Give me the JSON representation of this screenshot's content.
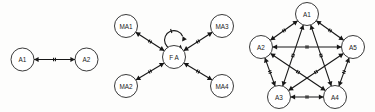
{
  "figure": {
    "name": "agent-interaction-graphs",
    "background_color": "#fdfdfc",
    "stroke_color": "#171717",
    "node_fill_color": "#ffffff",
    "node_stroke_color": "#242424",
    "label_color": "#1a1a1a",
    "node_font_size": 6.4,
    "node_radius": 11.5,
    "edge_stroke_width": 1.1,
    "node_stroke_width": 0.9,
    "edge_style": "double-headed arrow with two tick marks at midpoint",
    "panel_count": 3
  },
  "panels": [
    {
      "id": "panel-left",
      "name": "two-agent-graph",
      "nodes": [
        {
          "id": "n_a1",
          "label": "A1",
          "cx": 22.5,
          "cy": 59.5,
          "r": 11.5
        },
        {
          "id": "n_a2",
          "label": "A2",
          "cx": 86.5,
          "cy": 59.5,
          "r": 11.5
        }
      ],
      "edges": [
        {
          "from": "n_a1",
          "to": "n_a2",
          "ticks": 2,
          "bidirectional": true
        }
      ],
      "self_loops": []
    },
    {
      "id": "panel-middle",
      "name": "star-federated-graph",
      "nodes": [
        {
          "id": "n_fa",
          "label": "F A",
          "cx": 174.0,
          "cy": 57.0,
          "r": 11.5
        },
        {
          "id": "n_ma1",
          "label": "MA1",
          "cx": 126.0,
          "cy": 26.0,
          "r": 11.5
        },
        {
          "id": "n_ma2",
          "label": "MA2",
          "cx": 126.0,
          "cy": 86.0,
          "r": 11.5
        },
        {
          "id": "n_ma3",
          "label": "MA3",
          "cx": 222.0,
          "cy": 26.0,
          "r": 11.5
        },
        {
          "id": "n_ma4",
          "label": "MA4",
          "cx": 222.0,
          "cy": 86.0,
          "r": 11.5
        }
      ],
      "edges": [
        {
          "from": "n_ma1",
          "to": "n_fa",
          "ticks": 2,
          "bidirectional": true
        },
        {
          "from": "n_ma2",
          "to": "n_fa",
          "ticks": 2,
          "bidirectional": true
        },
        {
          "from": "n_fa",
          "to": "n_ma3",
          "ticks": 2,
          "bidirectional": true
        },
        {
          "from": "n_fa",
          "to": "n_ma4",
          "ticks": 2,
          "bidirectional": true
        }
      ],
      "self_loops": [
        {
          "on": "n_fa",
          "position": "top",
          "ticks": 1,
          "bidirectional": true
        }
      ]
    },
    {
      "id": "panel-right",
      "name": "five-agent-complete-graph",
      "nodes": [
        {
          "id": "n_p1",
          "label": "A1",
          "cx": 307.0,
          "cy": 14.0,
          "r": 11.5
        },
        {
          "id": "n_p2",
          "label": "A2",
          "cx": 261.0,
          "cy": 47.0,
          "r": 11.5
        },
        {
          "id": "n_p5",
          "label": "A5",
          "cx": 353.0,
          "cy": 47.0,
          "r": 11.5
        },
        {
          "id": "n_p3",
          "label": "A3",
          "cx": 279.0,
          "cy": 97.0,
          "r": 11.5
        },
        {
          "id": "n_p4",
          "label": "A4",
          "cx": 335.0,
          "cy": 97.0,
          "r": 11.5
        }
      ],
      "edges": [
        {
          "from": "n_p1",
          "to": "n_p2",
          "ticks": 2,
          "bidirectional": true
        },
        {
          "from": "n_p1",
          "to": "n_p5",
          "ticks": 2,
          "bidirectional": true
        },
        {
          "from": "n_p1",
          "to": "n_p3",
          "ticks": 2,
          "bidirectional": true
        },
        {
          "from": "n_p1",
          "to": "n_p4",
          "ticks": 2,
          "bidirectional": true
        },
        {
          "from": "n_p2",
          "to": "n_p5",
          "ticks": 2,
          "bidirectional": true
        },
        {
          "from": "n_p2",
          "to": "n_p3",
          "ticks": 2,
          "bidirectional": true
        },
        {
          "from": "n_p2",
          "to": "n_p4",
          "ticks": 2,
          "bidirectional": true
        },
        {
          "from": "n_p3",
          "to": "n_p4",
          "ticks": 2,
          "bidirectional": true
        },
        {
          "from": "n_p3",
          "to": "n_p5",
          "ticks": 2,
          "bidirectional": true
        },
        {
          "from": "n_p4",
          "to": "n_p5",
          "ticks": 2,
          "bidirectional": true
        }
      ],
      "self_loops": []
    }
  ]
}
